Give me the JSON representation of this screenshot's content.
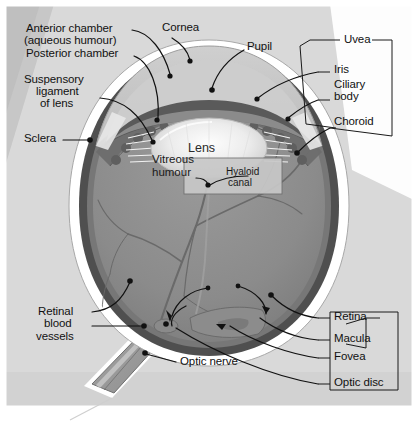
{
  "diagram": {
    "type": "anatomical-cross-section",
    "background_color": "#d9d9d9",
    "border_color": "#ffffff",
    "palette": {
      "sclera_white": "#ffffff",
      "choroid_dark": "#4a4a4a",
      "retina_mid": "#7b7b7b",
      "vitreous_gray": "#8f8f8f",
      "iris_dark": "#5c5c5c",
      "cornea_light": "#c6c6c6",
      "lens_light": "#efefef",
      "optic_nerve_gray": "#9a9a9a",
      "leader_line": "#111111",
      "bracket_line": "#1a1a1a",
      "label_text": "#111111"
    }
  },
  "labels": {
    "anterior_chamber": "Anterior chamber",
    "aqueous_humour": "(aqueous humour)",
    "posterior_chamber": "Posterior chamber",
    "suspensory": "Suspensory",
    "ligament": "ligament",
    "of_lens": "of lens",
    "sclera": "Sclera",
    "cornea": "Cornea",
    "pupil": "Pupil",
    "uvea": "Uvea",
    "iris": "Iris",
    "ciliary": "Ciliary",
    "body": "body",
    "choroid": "Choroid",
    "lens": "Lens",
    "vitreous": "Vitreous",
    "humour": "humour",
    "hyaloid": "Hyaloid",
    "canal": "canal",
    "retinal": "Retinal",
    "blood": "blood",
    "vessels": "vessels",
    "optic_nerve": "Optic nerve",
    "retina": "Retina",
    "macula": "Macula",
    "fovea": "Fovea",
    "optic_disc": "Optic disc"
  },
  "groupings": {
    "uvea_members": [
      "Iris",
      "Ciliary body",
      "Choroid"
    ],
    "retina_members": [
      "Macula",
      "Fovea"
    ],
    "outer_group_members": [
      "Retina",
      "Macula",
      "Fovea",
      "Optic disc"
    ]
  },
  "structures": [
    {
      "name": "cornea",
      "label": "Cornea"
    },
    {
      "name": "anterior-chamber",
      "label": "Anterior chamber (aqueous humour)"
    },
    {
      "name": "posterior-chamber",
      "label": "Posterior chamber"
    },
    {
      "name": "pupil",
      "label": "Pupil"
    },
    {
      "name": "iris",
      "label": "Iris"
    },
    {
      "name": "lens",
      "label": "Lens"
    },
    {
      "name": "suspensory-ligament",
      "label": "Suspensory ligament of lens"
    },
    {
      "name": "ciliary-body",
      "label": "Ciliary body"
    },
    {
      "name": "choroid",
      "label": "Choroid"
    },
    {
      "name": "sclera",
      "label": "Sclera"
    },
    {
      "name": "vitreous-humour",
      "label": "Vitreous humour"
    },
    {
      "name": "hyaloid-canal",
      "label": "Hyaloid canal"
    },
    {
      "name": "retina",
      "label": "Retina"
    },
    {
      "name": "macula",
      "label": "Macula"
    },
    {
      "name": "fovea",
      "label": "Fovea"
    },
    {
      "name": "optic-disc",
      "label": "Optic disc"
    },
    {
      "name": "optic-nerve",
      "label": "Optic nerve"
    },
    {
      "name": "retinal-blood-vessels",
      "label": "Retinal blood vessels"
    }
  ]
}
